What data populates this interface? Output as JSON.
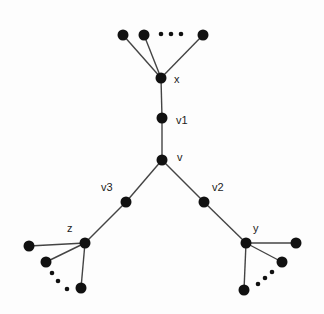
{
  "diagram": {
    "type": "tree-graph",
    "node_color": "#111111",
    "edge_color": "#444444",
    "nodes": [
      {
        "id": "x",
        "label": "x",
        "cx": 161,
        "cy": 78,
        "lx": 174,
        "ly": 74
      },
      {
        "id": "v1",
        "label": "v1",
        "cx": 162,
        "cy": 118,
        "lx": 176,
        "ly": 115
      },
      {
        "id": "v",
        "label": "v",
        "cx": 162,
        "cy": 160,
        "lx": 177,
        "ly": 152
      },
      {
        "id": "v3",
        "label": "v3",
        "cx": 126,
        "cy": 202,
        "lx": 101,
        "ly": 182
      },
      {
        "id": "v2",
        "label": "v2",
        "cx": 204,
        "cy": 202,
        "lx": 212,
        "ly": 182
      },
      {
        "id": "z",
        "label": "z",
        "cx": 85,
        "cy": 243,
        "lx": 67,
        "ly": 223
      },
      {
        "id": "y",
        "label": "y",
        "cx": 246,
        "cy": 243,
        "lx": 253,
        "ly": 223
      }
    ],
    "leaves": [
      {
        "parent": "x",
        "cx": 123,
        "cy": 35
      },
      {
        "parent": "x",
        "cx": 144,
        "cy": 35
      },
      {
        "parent": "x",
        "cx": 203,
        "cy": 35
      },
      {
        "parent": "z",
        "cx": 29,
        "cy": 246
      },
      {
        "parent": "z",
        "cx": 46,
        "cy": 262
      },
      {
        "parent": "z",
        "cx": 81,
        "cy": 288
      },
      {
        "parent": "y",
        "cx": 296,
        "cy": 243
      },
      {
        "parent": "y",
        "cx": 282,
        "cy": 262
      },
      {
        "parent": "y",
        "cx": 244,
        "cy": 290
      }
    ],
    "edges": [
      [
        "x",
        "v1"
      ],
      [
        "v1",
        "v"
      ],
      [
        "v",
        "v3"
      ],
      [
        "v",
        "v2"
      ],
      [
        "v3",
        "z"
      ],
      [
        "v2",
        "y"
      ]
    ],
    "ellipses": [
      {
        "near": "x",
        "dots": [
          [
            161,
            34
          ],
          [
            171,
            34
          ],
          [
            181,
            34
          ]
        ]
      },
      {
        "near": "z",
        "dots": [
          [
            52,
            273
          ],
          [
            58,
            281
          ],
          [
            67,
            289
          ]
        ]
      },
      {
        "near": "y",
        "dots": [
          [
            272,
            272
          ],
          [
            265,
            278
          ],
          [
            258,
            284
          ]
        ]
      }
    ]
  }
}
